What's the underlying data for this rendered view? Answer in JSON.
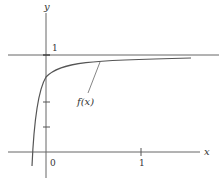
{
  "figure": {
    "x_axis_label": "x",
    "y_axis_label": "y",
    "y_tick_label_1": "1",
    "x_tick_label_0": "0",
    "x_tick_label_1": "1",
    "curve_label": "f(x)",
    "asymptote": "y = 1",
    "colors": {
      "line": "#555555",
      "text": "#333333"
    }
  }
}
